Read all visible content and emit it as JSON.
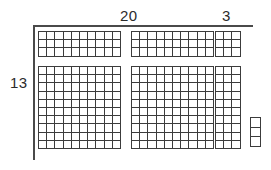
{
  "diagram": {
    "grid_color": "#3c3c3c",
    "axis_color": "#4a4a4a",
    "background": "#ffffff"
  },
  "labels": {
    "top_left": "20",
    "top_right": "3",
    "left": "13"
  },
  "chart_data": {
    "type": "area-model",
    "width_total": 23,
    "height_total": 13,
    "width_parts": [
      20,
      3
    ],
    "height_parts": [
      3,
      10
    ],
    "blocks": [
      {
        "name": "top-left-block",
        "cols": 10,
        "rows": 3,
        "x": 38,
        "y": 31,
        "cell": 8.2
      },
      {
        "name": "top-middle-block",
        "cols": 10,
        "rows": 3,
        "x": 131,
        "y": 31,
        "cell": 8.2
      },
      {
        "name": "top-right-block",
        "cols": 3,
        "rows": 3,
        "x": 215,
        "y": 31,
        "cell": 8.2
      },
      {
        "name": "bottom-left-block",
        "cols": 10,
        "rows": 10,
        "x": 38,
        "y": 66,
        "cell": 8.2
      },
      {
        "name": "bottom-middle-block",
        "cols": 10,
        "rows": 10,
        "x": 131,
        "y": 66,
        "cell": 8.2
      },
      {
        "name": "bottom-right-block",
        "cols": 3,
        "rows": 10,
        "x": 215,
        "y": 66,
        "cell": 8.2
      },
      {
        "name": "unit-strip-block",
        "cols": 1,
        "rows": 3,
        "x": 250,
        "y": 117,
        "cell": 9.6
      }
    ]
  }
}
